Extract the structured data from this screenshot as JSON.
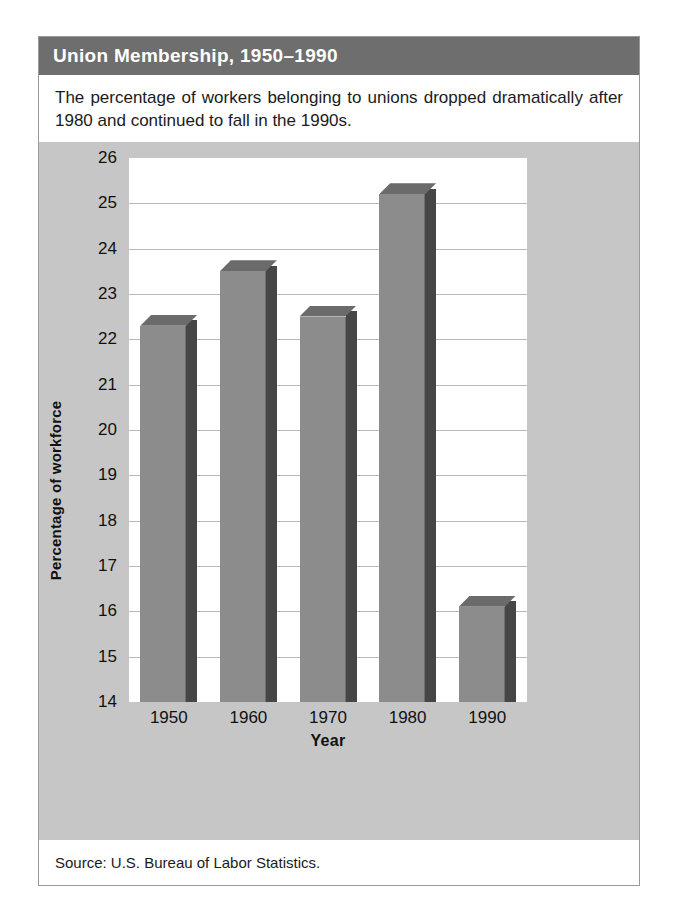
{
  "figure": {
    "title": "Union Membership, 1950–1990",
    "caption": "The percentage of workers belonging to unions dropped dramatically after 1980 and continued to fall in the 1990s.",
    "source": "Source: U.S. Bureau of Labor Statistics.",
    "colors": {
      "title_bar": "#6e6e6e",
      "title_text": "#ffffff",
      "panel_background": "#c6c6c6",
      "plot_background": "#ffffff",
      "bar_front": "#8c8c8c",
      "bar_side": "#464646",
      "bar_top": "#6b6b6b",
      "gridline": "#b9b9b9",
      "card_border": "#9a9a9a"
    }
  },
  "chart_data": {
    "type": "bar",
    "title": "Union Membership, 1950–1990",
    "xlabel": "Year",
    "ylabel": "Percentage of workforce",
    "categories": [
      "1950",
      "1960",
      "1970",
      "1980",
      "1990"
    ],
    "values": [
      22.3,
      23.5,
      22.5,
      25.2,
      16.1
    ],
    "ylim": [
      14,
      26
    ],
    "ytick_step": 1,
    "yticks": [
      14,
      15,
      16,
      17,
      18,
      19,
      20,
      21,
      22,
      23,
      24,
      25,
      26
    ],
    "ytick_labels": [
      "14",
      "15",
      "16",
      "17",
      "18",
      "19",
      "20",
      "21",
      "22",
      "23",
      "24",
      "25",
      "26"
    ],
    "xticks": [
      "1950",
      "1960",
      "1970",
      "1980",
      "1990"
    ],
    "grid": true,
    "grid_axis": "y",
    "legend": false,
    "style_3d": true
  }
}
